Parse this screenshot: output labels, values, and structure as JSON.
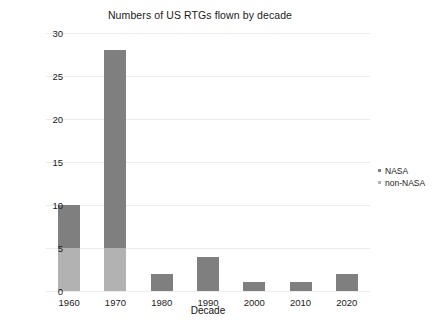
{
  "chart_data": {
    "type": "bar",
    "barmode": "stacked",
    "title": "Numbers of US RTGs flown by decade",
    "xlabel": "Decade",
    "ylabel": "",
    "categories": [
      "1960",
      "1970",
      "1980",
      "1990",
      "2000",
      "2010",
      "2020"
    ],
    "series": [
      {
        "name": "NASA",
        "color": "#7f7f7f",
        "values": [
          5,
          23,
          2,
          4,
          1,
          1,
          2
        ]
      },
      {
        "name": "non-NASA",
        "color": "#b2b2b2",
        "values": [
          5,
          5,
          0,
          0,
          0,
          0,
          0
        ]
      }
    ],
    "totals": [
      10,
      28,
      2,
      4,
      1,
      1,
      2
    ],
    "ylim": [
      0,
      30
    ],
    "yticks": [
      0,
      5,
      10,
      15,
      20,
      25,
      30
    ],
    "ytick_labels": [
      "0",
      "5",
      "10",
      "15",
      "20",
      "25",
      "30"
    ],
    "grid": true,
    "grid_color": "#ececed",
    "legend_position": "right",
    "legend": [
      "NASA",
      "non-NASA"
    ],
    "background": "#ffffff"
  }
}
